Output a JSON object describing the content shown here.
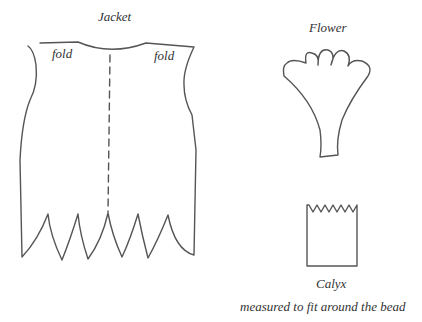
{
  "diagram": {
    "type": "sewing-pattern",
    "pieces": [
      {
        "id": "jacket",
        "title": "Jacket",
        "annotations": [
          "fold",
          "fold"
        ],
        "has_center_fold_line": true,
        "hem": "pointed scallops (6 points)"
      },
      {
        "id": "flower",
        "title": "Flower",
        "shape": "fan with 5 scalloped petals tapering to stem"
      },
      {
        "id": "calyx",
        "title": "Calyx",
        "shape": "rectangle with zigzag top edge",
        "note": "measured to fit around the bead"
      }
    ]
  },
  "labels": {
    "jacket_title": "Jacket",
    "fold_left": "fold",
    "fold_right": "fold",
    "flower_title": "Flower",
    "calyx_title": "Calyx",
    "calyx_note": "measured to fit around the bead"
  },
  "colors": {
    "line": "#555555",
    "background": "#ffffff"
  }
}
